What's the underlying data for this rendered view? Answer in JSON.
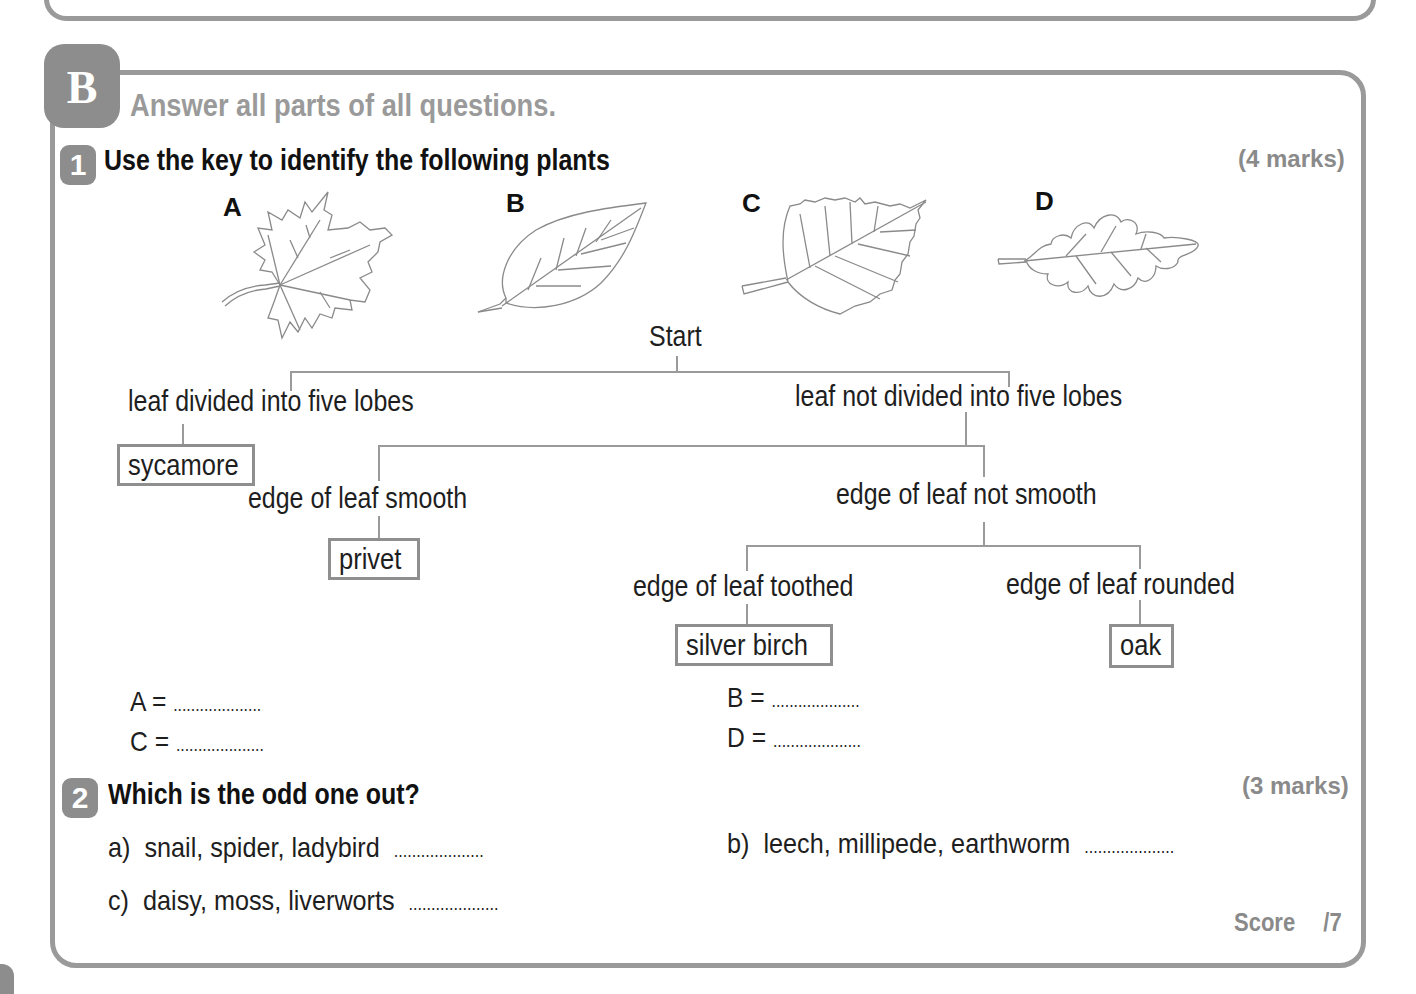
{
  "section": {
    "badge": "B",
    "instruction": "Answer all parts of all questions."
  },
  "question1": {
    "number": "1",
    "title": "Use the key to identify the following plants",
    "marks": "(4 marks)",
    "leaves": [
      {
        "label": "A",
        "shape": "maple-leaf-icon"
      },
      {
        "label": "B",
        "shape": "smooth-leaf-icon"
      },
      {
        "label": "C",
        "shape": "toothed-leaf-icon"
      },
      {
        "label": "D",
        "shape": "lobed-oak-leaf-icon"
      }
    ],
    "key": {
      "start": "Start",
      "lobes_yes": "leaf divided into five lobes",
      "lobes_no": "leaf not divided into five lobes",
      "smooth": "edge of leaf smooth",
      "not_smooth": "edge of leaf not smooth",
      "toothed": "edge of leaf toothed",
      "rounded": "edge of leaf rounded",
      "results": {
        "sycamore": "sycamore",
        "privet": "privet",
        "silver_birch": "silver birch",
        "oak": "oak"
      }
    },
    "answers": [
      {
        "label": "A =",
        "blank": "...................."
      },
      {
        "label": "B =",
        "blank": "...................."
      },
      {
        "label": "C =",
        "blank": "...................."
      },
      {
        "label": "D =",
        "blank": "...................."
      }
    ]
  },
  "question2": {
    "number": "2",
    "title": "Which is the odd one out?",
    "marks": "(3 marks)",
    "items": [
      {
        "label": "a)",
        "text": "snail, spider, ladybird",
        "blank": "...................."
      },
      {
        "label": "b)",
        "text": "leech, millipede, earthworm",
        "blank": "...................."
      },
      {
        "label": "c)",
        "text": "daisy, moss, liverworts",
        "blank": "...................."
      }
    ]
  },
  "score": {
    "label": "Score",
    "total": "/7"
  }
}
